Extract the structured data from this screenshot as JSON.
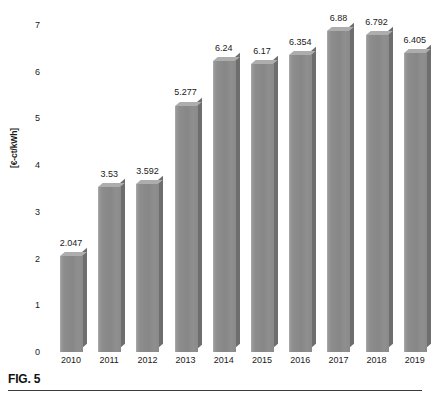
{
  "figure": {
    "caption": "FIG. 5"
  },
  "chart_data": {
    "type": "bar",
    "title": "",
    "xlabel": "",
    "ylabel": "[€-ct/kWh]",
    "categories": [
      "2010",
      "2011",
      "2012",
      "2013",
      "2014",
      "2015",
      "2016",
      "2017",
      "2018",
      "2019"
    ],
    "values": [
      2.047,
      3.53,
      3.592,
      5.277,
      6.24,
      6.17,
      6.354,
      6.88,
      6.792,
      6.405
    ],
    "value_labels": [
      "2.047",
      "3.53",
      "3.592",
      "5.277",
      "6.24",
      "6.17",
      "6.354",
      "6.88",
      "6.792",
      "6.405"
    ],
    "ylim": [
      0,
      7
    ],
    "yticks": [
      0,
      1,
      2,
      3,
      4,
      5,
      6,
      7
    ],
    "ytick_labels": [
      "0",
      "1",
      "2",
      "3",
      "4",
      "5",
      "6",
      "7"
    ],
    "grid": false,
    "legend": null,
    "bar_color": "#8a8a8a",
    "bar_top_color": "#adadad",
    "bar_side_color": "#6e6e6e",
    "background": "#ffffff"
  }
}
